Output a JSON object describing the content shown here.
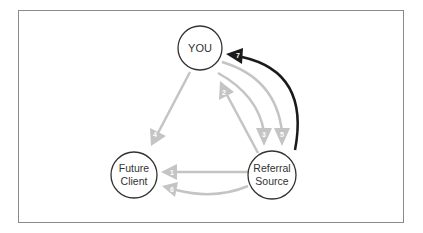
{
  "diagram": {
    "title": "",
    "colors": {
      "frame": "#8a8a8a",
      "node_stroke": "#333333",
      "light_arrow": "#bdbdbd",
      "dark_arrow": "#1a1a1a",
      "number_text": "#ffffff"
    },
    "nodes": [
      {
        "id": "you",
        "lines": [
          "YOU"
        ]
      },
      {
        "id": "future-client",
        "lines": [
          "Future",
          "Client"
        ]
      },
      {
        "id": "referral-source",
        "lines": [
          "Referral",
          "Source"
        ]
      }
    ],
    "arrows": [
      {
        "step": "1",
        "from": "referral-source",
        "to": "future-client",
        "style": "light"
      },
      {
        "step": "2",
        "from": "referral-source",
        "to": "you",
        "style": "light"
      },
      {
        "step": "3",
        "from": "you",
        "to": "referral-source",
        "style": "light"
      },
      {
        "step": "4",
        "from": "you",
        "to": "future-client",
        "style": "light"
      },
      {
        "step": "5",
        "from": "you",
        "to": "referral-source",
        "style": "light"
      },
      {
        "step": "6",
        "from": "referral-source",
        "to": "future-client",
        "style": "light"
      },
      {
        "step": "7",
        "from": "referral-source",
        "to": "you",
        "style": "dark"
      }
    ]
  }
}
